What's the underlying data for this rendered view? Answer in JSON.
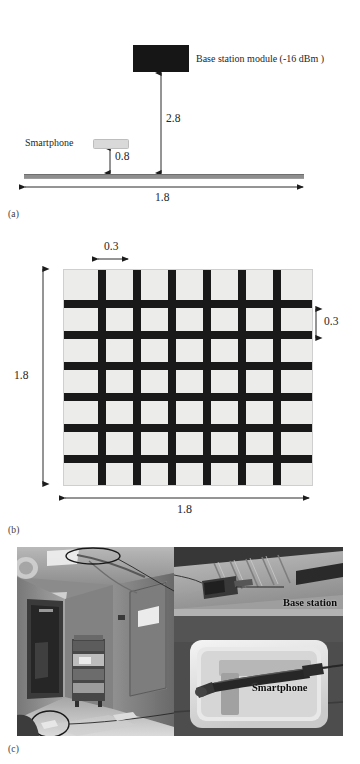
{
  "figure": {
    "panels": [
      {
        "tag": "(a)",
        "name": "side-view-schematic",
        "labels": {
          "base_station": "Base station module (-16 dBm )",
          "smartphone": "Smartphone"
        },
        "dimensions": {
          "base_station_height": "2.8",
          "smartphone_height": "0.8",
          "corridor_width": "1.8"
        }
      },
      {
        "tag": "(b)",
        "name": "grid-plan-schematic",
        "dimensions": {
          "bar_width": "0.3",
          "bar_spacing": "0.3",
          "grid_height": "1.8",
          "grid_width": "1.8"
        },
        "grid": {
          "vertical_bars": 6,
          "horizontal_bars": 6,
          "fill_color": "#ececeb",
          "bar_color": "#191919"
        }
      },
      {
        "tag": "(c)",
        "name": "photo-collage",
        "captions": {
          "base_station": "Base station",
          "smartphone": "Smartphone"
        }
      }
    ]
  },
  "colors": {
    "module_dark": "#161616",
    "phone_light": "#d9d9d9",
    "ground": "#8e8e8e",
    "ink": "#1a1a1a"
  }
}
